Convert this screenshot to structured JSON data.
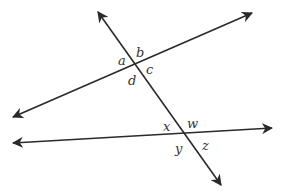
{
  "diagram": {
    "type": "two lines cut by a transversal",
    "line_color": "#2a2a2a",
    "label_color": "#333333",
    "lines": [
      {
        "name": "upper-line",
        "x1": 13,
        "y1": 117,
        "x2": 252,
        "y2": 13
      },
      {
        "name": "lower-line",
        "x1": 13,
        "y1": 143,
        "x2": 272,
        "y2": 128
      },
      {
        "name": "transversal",
        "x1": 98,
        "y1": 12,
        "x2": 221,
        "y2": 185
      }
    ],
    "labels": {
      "a": "a",
      "b": "b",
      "c": "c",
      "d": "d",
      "x": "x",
      "w": "w",
      "y": "y",
      "z": "z"
    }
  }
}
